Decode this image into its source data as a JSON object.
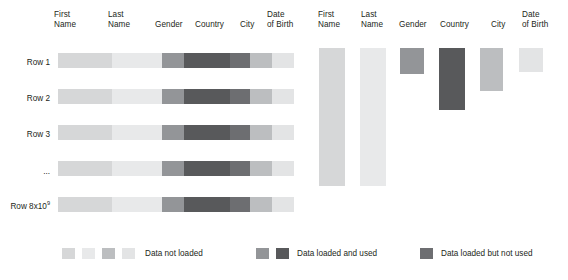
{
  "figure": {
    "type": "diagram",
    "title": ""
  },
  "columns": [
    {
      "key": "first_name",
      "label": "First\nName"
    },
    {
      "key": "last_name",
      "label": "Last\nName"
    },
    {
      "key": "gender",
      "label": "Gender"
    },
    {
      "key": "country",
      "label": "Country"
    },
    {
      "key": "city",
      "label": "City"
    },
    {
      "key": "date_of_birth",
      "label": "Date\nof Birth"
    }
  ],
  "rows": [
    {
      "label": "Row 1",
      "sup": ""
    },
    {
      "label": "Row 2",
      "sup": ""
    },
    {
      "label": "Row 3",
      "sup": ""
    },
    {
      "label": "...",
      "sup": ""
    },
    {
      "label": "Row 8x10",
      "sup": "9"
    }
  ],
  "colors": {
    "not_loaded_a": "#d6d7d8",
    "not_loaded_b": "#e8e9ea",
    "not_loaded_c": "#bcbec0",
    "not_loaded_d": "#e3e4e5",
    "loaded_used_light": "#939598",
    "loaded_used_dark": "#58595b",
    "loaded_unused": "#6d6e71"
  },
  "left_panel": {
    "name": "row-oriented-table",
    "row_cell_colors": [
      "#d6d7d8",
      "#e8e9ea",
      "#939598",
      "#58595b",
      "#6d6e71",
      "#bcbec0",
      "#e3e4e5"
    ]
  },
  "right_panel": {
    "name": "column-oriented-table",
    "bars": [
      {
        "column": "First Name",
        "color": "#d6d7d8",
        "height_pct": 100
      },
      {
        "column": "Last Name",
        "color": "#e8e9ea",
        "height_pct": 100
      },
      {
        "column": "Gender",
        "color": "#939598",
        "height_pct": 20
      },
      {
        "column": "Country",
        "color": "#58595b",
        "height_pct": 45
      },
      {
        "column": "City",
        "color": "#bcbec0",
        "height_pct": 30
      },
      {
        "column": "Date of Birth",
        "color": "#e3e4e5",
        "height_pct": 17
      }
    ]
  },
  "legend": {
    "items": [
      {
        "label": "Data not loaded",
        "swatches": [
          "#d6d7d8",
          "#e8e9ea",
          "#bcbec0",
          "#e3e4e5"
        ]
      },
      {
        "label": "Data loaded and used",
        "swatches": [
          "#939598",
          "#58595b"
        ]
      },
      {
        "label": "Data loaded but not used",
        "swatches": [
          "#6d6e71"
        ]
      }
    ]
  }
}
